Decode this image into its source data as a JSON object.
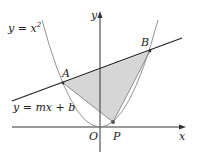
{
  "labels": {
    "curve": "y = x",
    "curve_exp": "2",
    "line": "y = mx + b",
    "point_a": "A",
    "point_b": "B",
    "point_p": "P",
    "origin": "O",
    "x_axis": "x",
    "y_axis": "y"
  },
  "colors": {
    "axis": "#333333",
    "line": "#222222",
    "parabola": "#888888",
    "shade": "#d6d6d6",
    "triangle_edge": "#777777"
  }
}
